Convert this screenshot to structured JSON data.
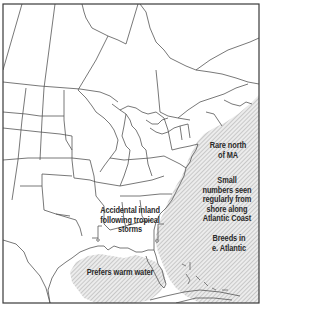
{
  "map": {
    "type": "range-map",
    "region": "Eastern North America",
    "colors": {
      "background": "#ffffff",
      "border": "#3a3a3a",
      "land_lines": "#555555",
      "range_fill": "#e9e9e9",
      "hatch": "#a8a8a8",
      "text": "#2a2a2a"
    },
    "annotations": {
      "rare_north": [
        "Rare north",
        "of MA"
      ],
      "small_numbers": [
        "Small",
        "numbers seen",
        "regularly from",
        "shore along",
        "Atlantic Coast"
      ],
      "breeds": [
        "Breeds in",
        "e. Atlantic"
      ],
      "accidental_inland": [
        "Accidental inland",
        "following tropical",
        "storms"
      ],
      "warm_water": [
        "Prefers warm water"
      ]
    },
    "legend": {
      "hatched_area": "range (at sea)"
    }
  }
}
